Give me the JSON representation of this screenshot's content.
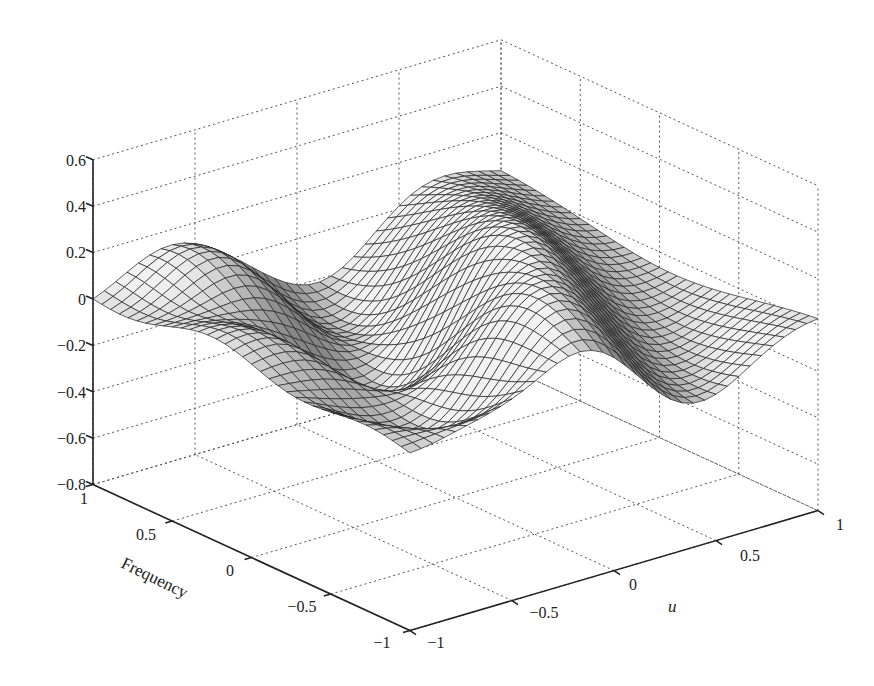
{
  "chart_data": {
    "type": "surface3d",
    "title": "",
    "xlabel": "u",
    "ylabel": "Frequency",
    "zlabel": "",
    "x_ticks": [
      "-1",
      "-0.5",
      "0",
      "0.5",
      "1"
    ],
    "y_ticks": [
      "1",
      "0.5",
      "0",
      "-0.5",
      "-1"
    ],
    "z_ticks": [
      "0.6",
      "0.4",
      "0.2",
      "0",
      "-0.2",
      "-0.4",
      "-0.6",
      "-0.8"
    ],
    "xlim": [
      -1,
      1
    ],
    "ylim": [
      -1,
      1
    ],
    "zlim": [
      -0.8,
      0.6
    ],
    "grid": true,
    "colormap": "gray",
    "x": [
      -1,
      -0.5,
      0,
      0.5,
      1
    ],
    "y": [
      -1,
      -0.5,
      0,
      0.5,
      1
    ],
    "z_sampled": [
      [
        -0.05,
        -0.2,
        0.05,
        0.1,
        0.0
      ],
      [
        -0.12,
        -0.35,
        0.3,
        0.15,
        0.0
      ],
      [
        -0.05,
        -0.3,
        0.35,
        0.1,
        0.0
      ],
      [
        0.0,
        -0.15,
        0.15,
        0.05,
        0.0
      ],
      [
        0.0,
        0.05,
        0.05,
        0.0,
        0.0
      ]
    ],
    "note": "z_sampled rows indexed by Frequency (y), columns by u (x); values estimated from surface shape"
  },
  "axes": {
    "u_label": "u",
    "frequency_label": "Frequency",
    "z_tick_labels": [
      "0.6",
      "0.4",
      "0.2",
      "0",
      "−0.2",
      "−0.4",
      "−0.6",
      "−0.8"
    ],
    "freq_tick_labels": [
      "1",
      "0.5",
      "0",
      "−0.5",
      "−1"
    ],
    "u_tick_labels": [
      "−1",
      "−0.5",
      "0",
      "0.5",
      "1"
    ]
  }
}
